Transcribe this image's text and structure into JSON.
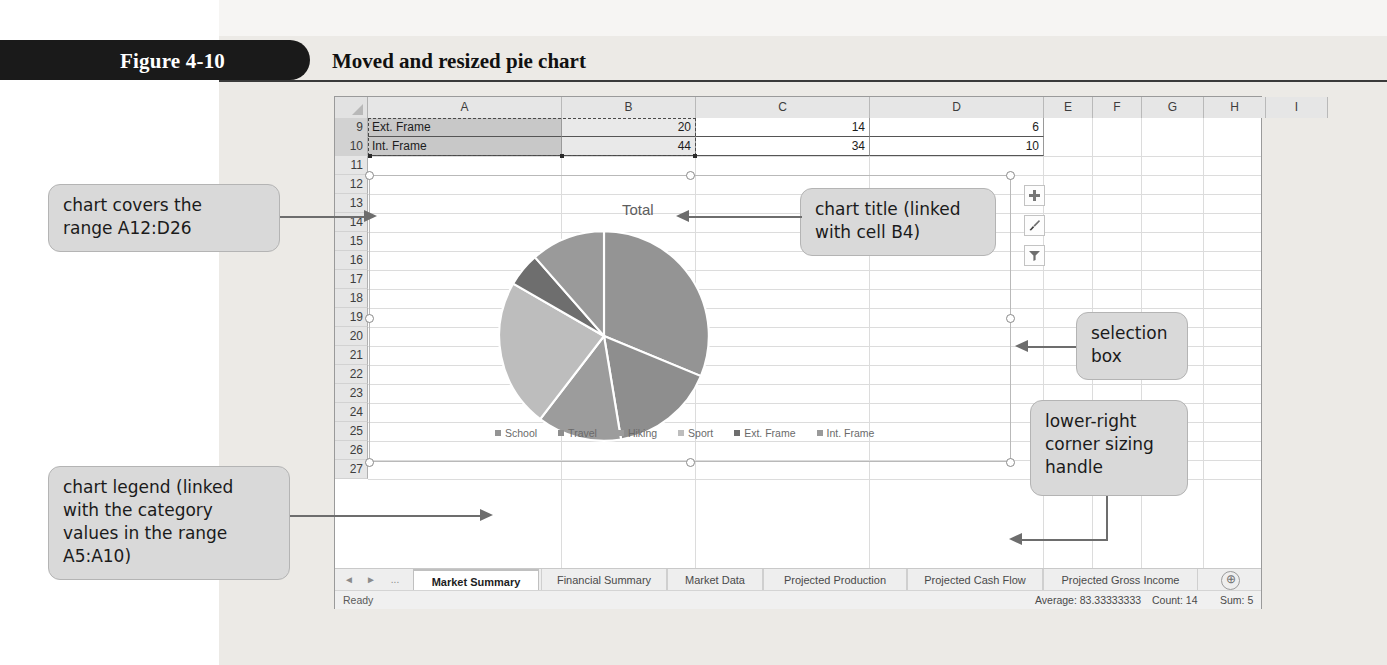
{
  "figure": {
    "number": "Figure 4-10",
    "caption": "Moved and resized pie chart"
  },
  "spreadsheet": {
    "columns": [
      "A",
      "B",
      "C",
      "D",
      "E",
      "F",
      "G",
      "H",
      "I"
    ],
    "rows": [
      "9",
      "10",
      "11",
      "12",
      "13",
      "14",
      "15",
      "16",
      "17",
      "18",
      "19",
      "20",
      "21",
      "22",
      "23",
      "24",
      "25",
      "26",
      "27"
    ],
    "data_rows": [
      {
        "row": "9",
        "a": "Ext. Frame",
        "b": "20",
        "c": "14",
        "d": "6"
      },
      {
        "row": "10",
        "a": "Int. Frame",
        "b": "44",
        "c": "34",
        "d": "10"
      }
    ]
  },
  "chart": {
    "title": "Total",
    "tools": [
      {
        "name": "chart-elements-button",
        "glyph": "+"
      },
      {
        "name": "chart-styles-button",
        "glyph": "brush"
      },
      {
        "name": "chart-filters-button",
        "glyph": "funnel"
      }
    ]
  },
  "chart_data": {
    "type": "pie",
    "title": "Total",
    "categories": [
      "School",
      "Travel",
      "Hiking",
      "Sport",
      "Ext. Frame",
      "Int. Frame"
    ],
    "values": [
      120,
      62,
      50,
      88,
      20,
      44
    ],
    "colors": [
      "#949494",
      "#8e8e8e",
      "#9c9c9c",
      "#bdbdbd",
      "#6e6e6e",
      "#9a9a9a"
    ],
    "legend_position": "bottom",
    "grid": false
  },
  "sheet_tabs": {
    "nav": [
      "◄",
      "►",
      "..."
    ],
    "tabs": [
      {
        "label": "Market Summary",
        "active": true
      },
      {
        "label": "Financial Summary",
        "active": false
      },
      {
        "label": "Market Data",
        "active": false
      },
      {
        "label": "Projected Production",
        "active": false
      },
      {
        "label": "Projected Cash Flow",
        "active": false
      },
      {
        "label": "Projected Gross Income",
        "active": false
      }
    ],
    "add_label": "⊕"
  },
  "status_bar": {
    "mode": "Ready",
    "average": "Average: 83.33333333",
    "count": "Count: 14",
    "sum": "Sum: 5"
  },
  "callouts": {
    "chart_range": "chart covers the\nrange A12:D26",
    "chart_legend": "chart legend (linked\nwith the category\nvalues in the range\nA5:A10)",
    "chart_title": "chart title (linked\nwith cell B4)",
    "selection_box": "selection\nbox",
    "sizing_handle": "lower-right\ncorner sizing\nhandle"
  },
  "colors": {
    "callout_bg": "#d9d9d9",
    "header_bar": "#1a1a1a",
    "page_bg": "#eceae6"
  }
}
